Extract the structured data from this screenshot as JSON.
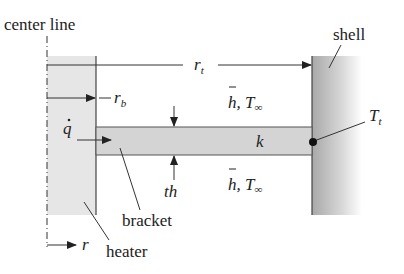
{
  "labels": {
    "center_line": "center line",
    "shell": "shell",
    "r_t": "r",
    "r_t_sub": "t",
    "r_b": "r",
    "r_b_sub": "b",
    "h_top": "h, T",
    "h_bottom": "h, T",
    "infinity": "∞",
    "q_dot": "q",
    "k": "k",
    "T_t": "T",
    "T_t_sub": "t",
    "th": "th",
    "bracket": "bracket",
    "heater": "heater",
    "r": "r"
  },
  "colors": {
    "heater_fill": "#e6e6e6",
    "bracket_fill": "#d4d4d4",
    "shell_dark": "#a8a8a8",
    "shell_light": "#ffffff",
    "line": "#333333"
  }
}
